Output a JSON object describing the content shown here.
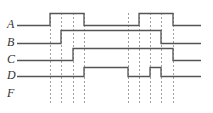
{
  "diagram": {
    "type": "timing-diagram",
    "signals": [
      {
        "label": "A",
        "y": 25,
        "y_high": 13,
        "transitions": [
          [
            17,
            "L"
          ],
          [
            50,
            "H"
          ],
          [
            84,
            "L"
          ],
          [
            139,
            "H"
          ],
          [
            173,
            "L"
          ]
        ],
        "end": 201
      },
      {
        "label": "B",
        "y": 43,
        "y_high": 30,
        "transitions": [
          [
            17,
            "L"
          ],
          [
            61,
            "H"
          ],
          [
            161,
            "L"
          ]
        ],
        "end": 201
      },
      {
        "label": "C",
        "y": 60,
        "y_high": 48,
        "transitions": [
          [
            17,
            "L"
          ],
          [
            73,
            "H"
          ],
          [
            173,
            "L"
          ]
        ],
        "end": 201
      },
      {
        "label": "D",
        "y": 76,
        "y_high": 67,
        "transitions": [
          [
            17,
            "L"
          ],
          [
            84,
            "H"
          ],
          [
            128,
            "L"
          ],
          [
            150,
            "H"
          ],
          [
            161,
            "L"
          ]
        ],
        "end": 201
      },
      {
        "label": "F",
        "y": 94,
        "transitions": []
      }
    ],
    "dashed_lines_x": [
      50,
      61,
      73,
      84,
      128,
      139,
      150,
      161,
      173
    ],
    "dashed_top": 13,
    "dashed_bottom": 104,
    "line_color": "#555555",
    "dash_color": "#888888"
  }
}
